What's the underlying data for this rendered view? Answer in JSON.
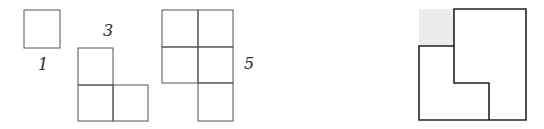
{
  "figure": {
    "shapes": [
      {
        "label": "1",
        "cells": 1
      },
      {
        "label": "3",
        "cells": 3
      },
      {
        "label": "5",
        "cells": 5
      }
    ],
    "composite": {
      "description": "Two overlapping L-shaped regions with a shaded square in the upper-left corner"
    }
  },
  "colors": {
    "stroke": "#3a3a3a",
    "shade": "#e8e8e8",
    "background": "#ffffff"
  }
}
